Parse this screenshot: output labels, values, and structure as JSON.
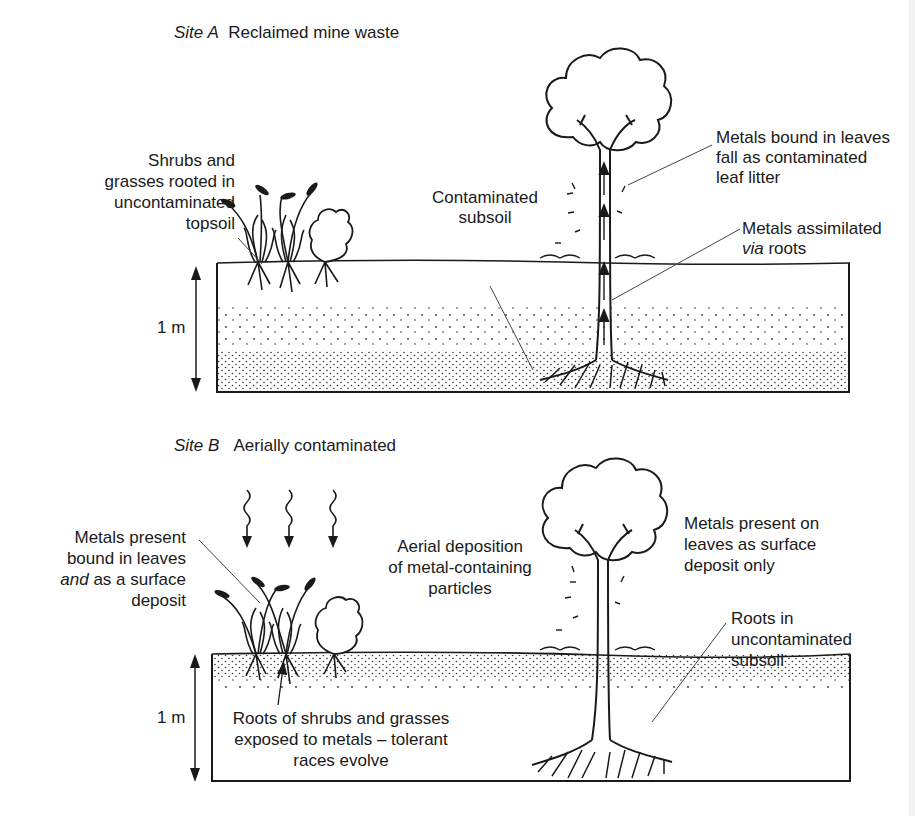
{
  "figure": {
    "panels": [
      {
        "id": "site-a",
        "title_italic": "Site A",
        "title": "Reclaimed mine waste",
        "depth_label": "1 m",
        "labels": {
          "shrubs": [
            "Shrubs and",
            "grasses rooted in",
            "uncontaminated",
            "topsoil"
          ],
          "subsoil": [
            "Contaminated",
            "subsoil"
          ],
          "leaves": [
            "Metals bound in leaves",
            "fall as contaminated",
            "leaf litter"
          ],
          "roots_line1": "Metals assimilated",
          "roots_line2_italic": "via",
          "roots_line2": " roots"
        }
      },
      {
        "id": "site-b",
        "title_italic": "Site B",
        "title": "Aerially contaminated",
        "depth_label": "1 m",
        "labels": {
          "metals_present_line1": "Metals present",
          "metals_present_line2": "bound in leaves",
          "metals_present_line3_italic": "and",
          "metals_present_line3": " as a surface",
          "metals_present_line4": "deposit",
          "aerial": [
            "Aerial deposition",
            "of metal-containing",
            "particles"
          ],
          "surface": [
            "Metals present on",
            "leaves as surface",
            "deposit only"
          ],
          "roots": [
            "Roots in",
            "uncontaminated",
            "subsoil"
          ],
          "tolerant": [
            "Roots of shrubs and grasses",
            "exposed to metals – tolerant",
            "races evolve"
          ]
        }
      }
    ],
    "colors": {
      "ink": "#1a1a1a",
      "background": "#ffffff",
      "leader": "#444444"
    }
  }
}
